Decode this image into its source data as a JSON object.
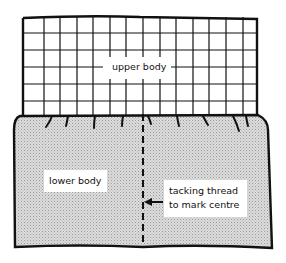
{
  "diagram": {
    "upper_body": {
      "label": "upper body",
      "fill": "#ffffff",
      "pattern": "grid"
    },
    "lower_body": {
      "label": "lower body",
      "fill": "#d2d2d2",
      "pattern": "stippled"
    },
    "annotation": {
      "line1": "tacking thread",
      "line2": "to mark centre",
      "arrow": "left-arrow"
    },
    "colors": {
      "outline": "#111111",
      "shading": "#d2d2d2",
      "background": "#ffffff"
    }
  }
}
